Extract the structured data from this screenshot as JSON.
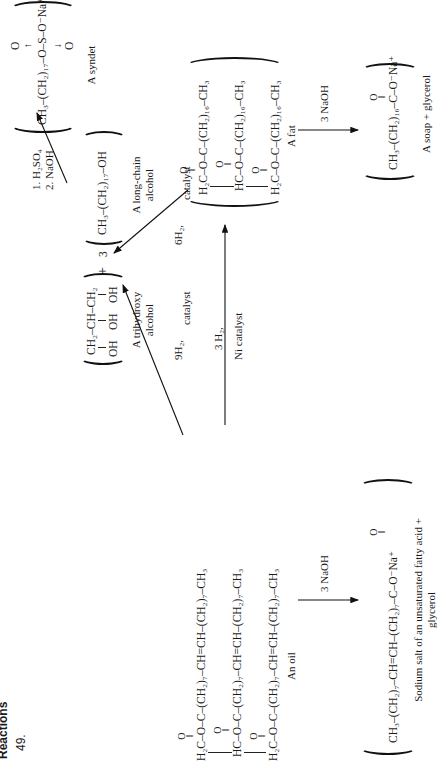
{
  "header": {
    "section": "Reactions",
    "problem_number": "49."
  },
  "oil": {
    "rows": [
      {
        "prefix": "H₂C",
        "chain": "–O–C–(CH₂)₇–CH=CH–(CH₂)₇–CH₃"
      },
      {
        "prefix": "HC",
        "chain": "–O–C–(CH₂)₇–CH=CH–(CH₂)₇–CH₃"
      },
      {
        "prefix": "H₂C",
        "chain": "–O–C–(CH₂)₇–CH=CH–(CH₂)₇–CH₃"
      }
    ],
    "carbonyl": "O",
    "label": "An oil"
  },
  "fat": {
    "rows": [
      {
        "prefix": "H₂C",
        "chain": "–O–C–(CH₂)₁₆–CH₃"
      },
      {
        "prefix": "HC",
        "chain": "–O–C–(CH₂)₁₆–CH₃"
      },
      {
        "prefix": "H₂C",
        "chain": "–O–C–(CH₂)₁₆–CH₃"
      }
    ],
    "carbonyl": "O",
    "label": "A fat"
  },
  "glycerol": {
    "top": "CH₂–CH–CH₂",
    "bottom": [
      "OH",
      "OH",
      "OH"
    ],
    "label_line1": "A trihydroxy",
    "label_line2": "alcohol"
  },
  "plus": "+",
  "coefficient": "3",
  "long_chain_alcohol": {
    "formula": "CH₃–(CH₂)₁₇–OH",
    "label_line1": "A long-chain",
    "label_line2": "alcohol"
  },
  "syndet": {
    "formula_left": "CH₃–(CH₂)₁₇–O–S–O",
    "charge": "⁻Na⁺",
    "o_top": "O",
    "o_bottom": "O",
    "label": "A syndet"
  },
  "soap": {
    "formula": "CH₃–(CH₂)₁₆–C–O⁻Na⁺",
    "carbonyl": "O",
    "label": "A soap  +  glycerol"
  },
  "salt": {
    "formula": "CH₃–(CH₂)₇–CH=CH–(CH₂)₇–C–O⁻Na⁺",
    "carbonyl": "O",
    "label_line1": "Sodium salt of an unsaturated fatty acid +",
    "label_line2": "glycerol"
  },
  "arrows": {
    "oil_to_fat": {
      "top": "3 H₂,",
      "bottom": "Ni catalyst"
    },
    "oil_to_alcohols": {
      "left": "9H₂,",
      "right": "catalyst"
    },
    "fat_to_alcohols": {
      "left": "6H₂,",
      "right": "catalyst"
    },
    "alcohol_to_syndet": {
      "line1": "1.  H₂SO₄",
      "line2": "2.  NaOH"
    },
    "fat_saponification": {
      "label": "3 NaOH"
    },
    "oil_saponification": {
      "label": "3 NaOH"
    }
  }
}
